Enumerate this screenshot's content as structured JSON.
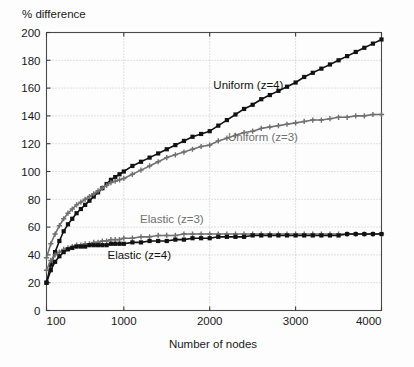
{
  "chart_data": {
    "type": "line",
    "title": "",
    "xlabel": "Number of nodes",
    "ylabel": "% difference",
    "xlim": [
      100,
      4000
    ],
    "ylim": [
      0,
      200
    ],
    "xticks": [
      100,
      1000,
      2000,
      3000,
      4000
    ],
    "xticklabels": [
      "100",
      "1000",
      "2000",
      "3000",
      "4000"
    ],
    "yticks": [
      0,
      20,
      40,
      60,
      80,
      100,
      120,
      140,
      160,
      180,
      200
    ],
    "yticklabels": [
      "0",
      "20",
      "40",
      "60",
      "80",
      "100",
      "120",
      "140",
      "160",
      "180",
      "200"
    ],
    "grid": true,
    "legend_position": "inline-annotations",
    "series": [
      {
        "name": "Uniform (z=4)",
        "color": "#121212",
        "marker": "square",
        "label_x": 2450,
        "label_y": 159,
        "x": [
          100,
          150,
          200,
          250,
          300,
          350,
          400,
          450,
          500,
          550,
          600,
          650,
          700,
          750,
          800,
          850,
          900,
          950,
          1000,
          1100,
          1200,
          1300,
          1400,
          1500,
          1600,
          1700,
          1800,
          1900,
          2000,
          2100,
          2200,
          2300,
          2400,
          2500,
          2600,
          2700,
          2800,
          2900,
          3000,
          3100,
          3200,
          3300,
          3400,
          3500,
          3600,
          3700,
          3800,
          3900,
          4000
        ],
        "y": [
          20,
          33,
          42,
          50,
          57,
          62,
          66,
          70,
          73,
          76,
          79,
          82,
          85,
          88,
          91,
          94,
          96,
          98,
          100,
          104,
          107,
          110,
          113,
          116,
          119,
          122,
          125,
          127,
          129,
          133,
          137,
          141,
          145,
          148,
          152,
          155,
          158,
          161,
          164,
          168,
          171,
          174,
          177,
          180,
          183,
          186,
          189,
          192,
          195
        ]
      },
      {
        "name": "Uniform (z=3)",
        "color": "#707070",
        "marker": "plus",
        "label_x": 2620,
        "label_y": 122,
        "x": [
          100,
          150,
          200,
          250,
          300,
          350,
          400,
          450,
          500,
          550,
          600,
          650,
          700,
          750,
          800,
          850,
          900,
          950,
          1000,
          1100,
          1200,
          1300,
          1400,
          1500,
          1600,
          1700,
          1800,
          1900,
          2000,
          2100,
          2200,
          2300,
          2400,
          2500,
          2600,
          2700,
          2800,
          2900,
          3000,
          3100,
          3200,
          3300,
          3400,
          3500,
          3600,
          3700,
          3800,
          3900,
          4000
        ],
        "y": [
          38,
          48,
          55,
          61,
          66,
          70,
          73,
          76,
          78,
          80,
          82,
          84,
          86,
          88,
          90,
          92,
          93,
          94,
          95,
          98,
          101,
          104,
          107,
          110,
          112,
          114,
          116,
          118,
          119,
          122,
          124,
          126,
          128,
          129,
          131,
          132,
          133,
          134,
          135,
          136,
          137,
          137,
          138,
          139,
          139,
          140,
          140,
          141,
          141
        ]
      },
      {
        "name": "Elastic (z=3)",
        "color": "#707070",
        "marker": "plus",
        "label_x": 1560,
        "label_y": 63,
        "x": [
          100,
          150,
          200,
          250,
          300,
          350,
          400,
          450,
          500,
          550,
          600,
          650,
          700,
          750,
          800,
          850,
          900,
          950,
          1000,
          1100,
          1200,
          1300,
          1400,
          1500,
          1600,
          1700,
          1800,
          1900,
          2000,
          2100,
          2200,
          2300,
          2400,
          2500,
          2600,
          2700,
          2800,
          2900,
          3000,
          3100,
          3200,
          3300,
          3400,
          3500,
          3600,
          3700,
          3800,
          3900,
          4000
        ],
        "y": [
          29,
          36,
          40,
          42,
          44,
          45,
          46,
          47,
          47,
          48,
          48,
          49,
          49,
          50,
          50,
          51,
          51,
          51,
          52,
          52,
          53,
          53,
          54,
          54,
          54,
          55,
          55,
          55,
          55,
          55,
          55,
          55,
          55,
          55,
          55,
          55,
          55,
          55,
          55,
          55,
          55,
          55,
          55,
          55,
          55,
          55,
          55,
          55,
          55
        ]
      },
      {
        "name": "Elastic (z=4)",
        "color": "#121212",
        "marker": "square",
        "label_x": 1180,
        "label_y": 37,
        "x": [
          100,
          150,
          200,
          250,
          300,
          350,
          400,
          450,
          500,
          550,
          600,
          650,
          700,
          750,
          800,
          850,
          900,
          950,
          1000,
          1100,
          1200,
          1300,
          1400,
          1500,
          1600,
          1700,
          1800,
          1900,
          2000,
          2100,
          2200,
          2300,
          2400,
          2500,
          2600,
          2700,
          2800,
          2900,
          3000,
          3100,
          3200,
          3300,
          3400,
          3500,
          3600,
          3700,
          3800,
          3900,
          4000
        ],
        "y": [
          20,
          29,
          35,
          39,
          42,
          44,
          45,
          46,
          46,
          46,
          47,
          47,
          47,
          47,
          47,
          48,
          48,
          48,
          48,
          49,
          49,
          50,
          50,
          50,
          51,
          51,
          52,
          52,
          52,
          53,
          53,
          53,
          53,
          54,
          54,
          54,
          54,
          54,
          54,
          54,
          54,
          54,
          54,
          54,
          55,
          55,
          55,
          55,
          55
        ]
      }
    ]
  },
  "colors": {
    "background": "#fdfdfd",
    "axis": "#4a4a4a",
    "grid": "#b9b9b9",
    "series_dark": "#121212",
    "series_gray": "#707070"
  }
}
